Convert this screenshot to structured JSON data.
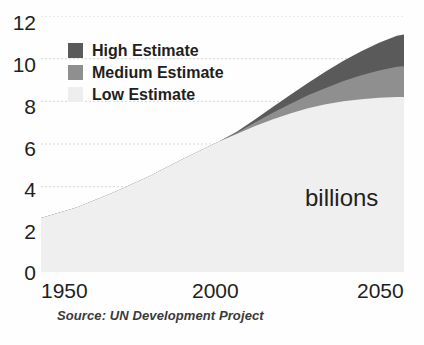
{
  "chart_data": {
    "type": "area",
    "title": "",
    "subtitle": "",
    "xlabel": "",
    "ylabel": "",
    "annotation": "billions",
    "source": "Source: UN Development Project",
    "stacked": true,
    "grid": true,
    "legend_position": "inside-top-left",
    "xlim": [
      1950,
      2052
    ],
    "ylim": [
      0,
      12
    ],
    "xticks": [
      1950,
      2000,
      2050
    ],
    "xtick_labels": [
      "1950",
      "2000",
      "2050"
    ],
    "yticks": [
      0,
      2,
      4,
      6,
      8,
      10,
      12
    ],
    "ytick_labels": [
      "0",
      "2",
      "4",
      "6",
      "8",
      "10",
      "12"
    ],
    "x": [
      1950,
      1960,
      1970,
      1980,
      1990,
      2000,
      2005,
      2010,
      2015,
      2020,
      2025,
      2030,
      2035,
      2040,
      2045,
      2050,
      2052
    ],
    "series": [
      {
        "name": "Low Estimate",
        "color": "#efefef",
        "values": [
          2.53,
          3.02,
          3.7,
          4.45,
          5.31,
          6.12,
          6.47,
          6.83,
          7.15,
          7.43,
          7.67,
          7.86,
          8.0,
          8.1,
          8.17,
          8.2,
          8.2
        ]
      },
      {
        "name": "Medium Estimate",
        "color": "#8f8f8f",
        "values": [
          2.53,
          3.02,
          3.7,
          4.45,
          5.31,
          6.12,
          6.53,
          7.0,
          7.45,
          7.88,
          8.28,
          8.63,
          8.95,
          9.22,
          9.45,
          9.62,
          9.65
        ]
      },
      {
        "name": "High Estimate",
        "color": "#5a5a5a",
        "values": [
          2.53,
          3.02,
          3.7,
          4.45,
          5.31,
          6.12,
          6.58,
          7.14,
          7.72,
          8.3,
          8.86,
          9.4,
          9.9,
          10.35,
          10.75,
          11.08,
          11.13
        ]
      }
    ],
    "legend": [
      {
        "label": "High Estimate",
        "color": "#5a5a5a"
      },
      {
        "label": "Medium Estimate",
        "color": "#8f8f8f"
      },
      {
        "label": "Low Estimate",
        "color": "#eeeeee"
      }
    ]
  },
  "colors": {
    "high": "#5a5a5a",
    "medium": "#8f8f8f",
    "low": "#efefef",
    "gridline": "#d8d8d8",
    "text": "#231f20",
    "background": "#ffffff"
  }
}
